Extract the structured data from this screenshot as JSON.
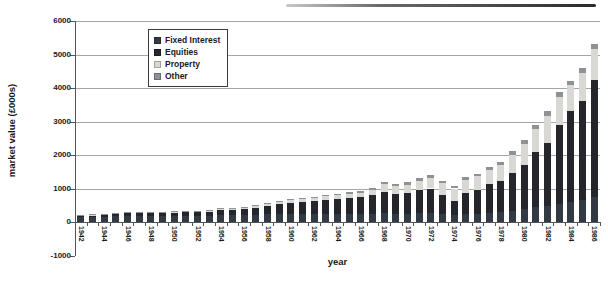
{
  "chart_data": {
    "type": "bar",
    "stacked": true,
    "title": "",
    "xlabel": "year",
    "ylabel": "market value (£000s)",
    "ylim": [
      -1000,
      6000
    ],
    "yticks": [
      6000,
      5000,
      4000,
      3000,
      2000,
      1000,
      0,
      -1000
    ],
    "grid": "horizontal",
    "legend_position": "top-left-inside",
    "categories": [
      1942,
      1943,
      1944,
      1945,
      1946,
      1947,
      1948,
      1949,
      1950,
      1951,
      1952,
      1953,
      1954,
      1955,
      1956,
      1957,
      1958,
      1959,
      1960,
      1961,
      1962,
      1963,
      1964,
      1965,
      1966,
      1967,
      1968,
      1969,
      1970,
      1971,
      1972,
      1973,
      1974,
      1975,
      1976,
      1977,
      1978,
      1979,
      1980,
      1981,
      1982,
      1983,
      1984,
      1985,
      1986
    ],
    "xtick_labels": [
      1942,
      1944,
      1946,
      1948,
      1950,
      1952,
      1954,
      1956,
      1958,
      1960,
      1962,
      1964,
      1966,
      1968,
      1970,
      1972,
      1974,
      1976,
      1978,
      1980,
      1982,
      1984,
      1986
    ],
    "series": [
      {
        "name": "Fixed Interest",
        "color": "#323a44",
        "values": [
          135,
          145,
          155,
          170,
          180,
          182,
          175,
          175,
          178,
          180,
          178,
          182,
          205,
          200,
          200,
          215,
          230,
          245,
          250,
          250,
          245,
          250,
          250,
          245,
          240,
          250,
          270,
          240,
          250,
          260,
          260,
          230,
          200,
          240,
          250,
          280,
          300,
          340,
          380,
          440,
          470,
          550,
          600,
          650,
          760
        ]
      },
      {
        "name": "Equities",
        "color": "#24262c",
        "values": [
          45,
          55,
          60,
          70,
          80,
          88,
          90,
          95,
          102,
          110,
          117,
          128,
          155,
          170,
          185,
          215,
          250,
          295,
          330,
          360,
          385,
          420,
          450,
          475,
          500,
          550,
          630,
          590,
          610,
          690,
          740,
          590,
          420,
          640,
          710,
          840,
          920,
          1110,
          1320,
          1660,
          1880,
          2350,
          2700,
          2970,
          3490
        ]
      },
      {
        "name": "Property",
        "color": "#d9d8d4",
        "values": [
          15,
          18,
          20,
          22,
          25,
          25,
          25,
          28,
          30,
          30,
          32,
          35,
          40,
          42,
          45,
          50,
          55,
          60,
          70,
          80,
          90,
          100,
          115,
          125,
          140,
          160,
          230,
          230,
          250,
          280,
          320,
          330,
          380,
          380,
          400,
          440,
          470,
          550,
          620,
          680,
          800,
          820,
          780,
          840,
          900
        ]
      },
      {
        "name": "Other",
        "color": "#8e9295",
        "values": [
          10,
          10,
          10,
          12,
          12,
          12,
          12,
          12,
          14,
          14,
          14,
          15,
          15,
          16,
          16,
          18,
          20,
          22,
          25,
          28,
          30,
          32,
          35,
          38,
          40,
          45,
          60,
          60,
          70,
          75,
          85,
          80,
          80,
          80,
          85,
          90,
          95,
          110,
          120,
          130,
          150,
          160,
          140,
          150,
          160
        ]
      }
    ]
  }
}
